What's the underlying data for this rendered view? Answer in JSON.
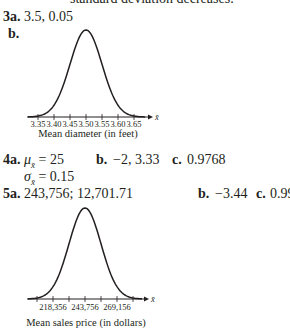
{
  "top_fragment": "standard deviation decreases.",
  "q3": {
    "a_label": "3a.",
    "a_answer": "3.5, 0.05",
    "b_label": "b."
  },
  "q4": {
    "a_label": "4a.",
    "mu_line": "μ",
    "mu_sub": "x̄",
    "mu_value": " = 25",
    "sigma_line": "σ",
    "sigma_sub": "x̄",
    "sigma_value": " = 0.15",
    "b_label": "b.",
    "b_answer": "−2, 3.33",
    "c_label": "c.",
    "c_answer": "0.9768"
  },
  "q5": {
    "a_label": "5a.",
    "a_answer": "243,756; 12,701.71",
    "b_label": "b.",
    "b_answer": "−3.44",
    "c_label": "c.",
    "c_answer": "0.9997"
  },
  "chart_data": [
    {
      "type": "line",
      "title": "",
      "description": "Normal distribution curve",
      "xlabel": "Mean diameter (in feet)",
      "axis_var": "x̄",
      "x_ticks": [
        "3.35",
        "3.40",
        "3.45",
        "3.50",
        "3.55",
        "3.60",
        "3.65"
      ],
      "mean": 3.5,
      "std": 0.05,
      "xlim": [
        3.32,
        3.68
      ]
    },
    {
      "type": "line",
      "title": "",
      "description": "Normal distribution curve",
      "xlabel": "Mean sales price (in dollars)",
      "axis_var": "x̄",
      "x_ticks": [
        "218,356",
        "243,756",
        "269,156"
      ],
      "mean": 243756,
      "std": 12700,
      "xlim": [
        205656,
        281856
      ]
    }
  ]
}
